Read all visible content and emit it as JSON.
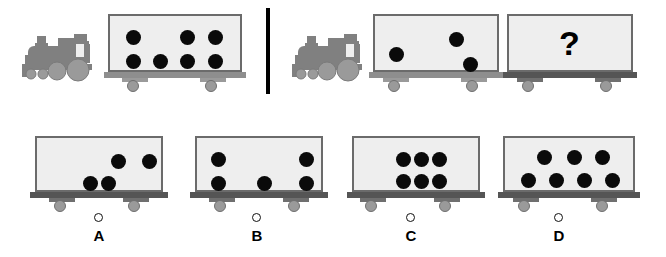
{
  "puzzle": {
    "type": "visual-analogy-matrix-reasoning",
    "divider_label": "vertical-separator",
    "question_symbol": "?"
  },
  "colors": {
    "car_body": "#eeeeee",
    "car_border": "#6b6b6b",
    "rail_dark": "#555555",
    "rail_light": "#8e8e8e",
    "wheel": "#9a9a9a",
    "dot": "#0a0a0a",
    "locomotive": "#808080",
    "divider": "#000000",
    "text": "#000000"
  },
  "top_row": {
    "left_panel": {
      "locomotive_label": "steam-locomotive",
      "cars": [
        {
          "id": "left-car-1",
          "dot_count": 7,
          "dots": [
            {
              "x": 18,
              "y": 16
            },
            {
              "x": 72,
              "y": 16
            },
            {
              "x": 100,
              "y": 16
            },
            {
              "x": 18,
              "y": 40
            },
            {
              "x": 45,
              "y": 40
            },
            {
              "x": 72,
              "y": 40
            },
            {
              "x": 100,
              "y": 40
            }
          ]
        }
      ]
    },
    "right_panel": {
      "locomotive_label": "steam-locomotive",
      "cars": [
        {
          "id": "right-car-1",
          "dot_count": 3,
          "dots": [
            {
              "x": 16,
              "y": 33
            },
            {
              "x": 76,
              "y": 18
            },
            {
              "x": 90,
              "y": 43
            }
          ]
        },
        {
          "id": "right-car-question",
          "dot_count": 0,
          "question": "?",
          "dots": []
        }
      ]
    }
  },
  "options": [
    {
      "id": "option-a",
      "label": "A",
      "dot_count": 4,
      "selected": false,
      "dots": [
        {
          "x": 76,
          "y": 18
        },
        {
          "x": 107,
          "y": 18
        },
        {
          "x": 48,
          "y": 40
        },
        {
          "x": 66,
          "y": 40
        }
      ]
    },
    {
      "id": "option-b",
      "label": "B",
      "dot_count": 5,
      "selected": false,
      "dots": [
        {
          "x": 16,
          "y": 16
        },
        {
          "x": 16,
          "y": 40
        },
        {
          "x": 62,
          "y": 40
        },
        {
          "x": 104,
          "y": 16
        },
        {
          "x": 104,
          "y": 40
        }
      ]
    },
    {
      "id": "option-c",
      "label": "C",
      "dot_count": 6,
      "selected": false,
      "dots": [
        {
          "x": 44,
          "y": 16
        },
        {
          "x": 62,
          "y": 16
        },
        {
          "x": 80,
          "y": 16
        },
        {
          "x": 44,
          "y": 38
        },
        {
          "x": 62,
          "y": 38
        },
        {
          "x": 80,
          "y": 38
        }
      ]
    },
    {
      "id": "option-d",
      "label": "D",
      "dot_count": 7,
      "selected": false,
      "dots": [
        {
          "x": 34,
          "y": 14
        },
        {
          "x": 64,
          "y": 14
        },
        {
          "x": 92,
          "y": 14
        },
        {
          "x": 18,
          "y": 37
        },
        {
          "x": 46,
          "y": 37
        },
        {
          "x": 74,
          "y": 37
        },
        {
          "x": 102,
          "y": 37
        }
      ]
    }
  ]
}
